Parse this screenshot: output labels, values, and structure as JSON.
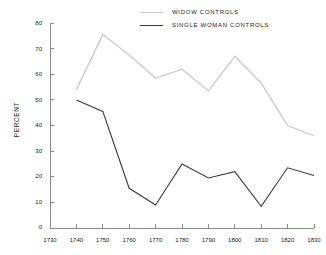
{
  "chart_data": {
    "type": "line",
    "title": "",
    "subtitle": "",
    "xlabel": "",
    "ylabel": "PERCENT",
    "xlim": [
      1730,
      1830
    ],
    "ylim": [
      0,
      80
    ],
    "grid": false,
    "legend_position": "top-center",
    "x_ticks": [
      1730,
      1740,
      1750,
      1760,
      1770,
      1780,
      1790,
      1800,
      1810,
      1820,
      1830
    ],
    "y_ticks": [
      0,
      10,
      20,
      30,
      40,
      50,
      60,
      70,
      80
    ],
    "x": [
      1740,
      1750,
      1760,
      1770,
      1780,
      1790,
      1800,
      1810,
      1820,
      1830
    ],
    "series": [
      {
        "name": "WIDOW CONTROLS",
        "color": "#c9c9c9",
        "line_width": 1.3,
        "values": [
          54,
          75.5,
          67.5,
          58.5,
          62,
          53.5,
          67,
          56.5,
          40,
          36
        ]
      },
      {
        "name": "SINGLE WOMAN CONTROLS",
        "color": "#3a3a3a",
        "line_width": 1.1,
        "values": [
          50,
          45.5,
          15.5,
          9,
          25,
          19.5,
          22,
          8.5,
          23.5,
          20.5
        ]
      }
    ]
  },
  "legend": {
    "entries": [
      {
        "label": "WIDOW CONTROLS"
      },
      {
        "label": "SINGLE WOMAN CONTROLS"
      }
    ]
  },
  "axes": {
    "y_title": "PERCENT",
    "y_tick_labels": [
      "80",
      "70",
      "60",
      "50",
      "40",
      "30",
      "20",
      "10",
      "0"
    ],
    "x_tick_labels": [
      "1730",
      "1740",
      "1750",
      "1760",
      "1770",
      "1780",
      "1790",
      "1800",
      "1810",
      "1820",
      "1830"
    ]
  },
  "colors": {
    "axis": "#8a8a8a",
    "text": "#1a1a1a",
    "widow_line": "#c9c9c9",
    "single_woman_line": "#3a3a3a",
    "background": "#ffffff"
  }
}
